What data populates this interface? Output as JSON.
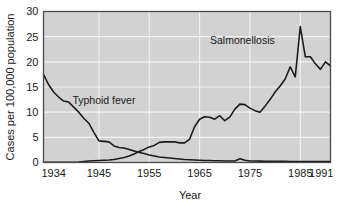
{
  "chart_data": {
    "type": "line",
    "title": "",
    "xlabel": "Year",
    "ylabel": "Cases per 100,000 population",
    "xlim": [
      1934,
      1991
    ],
    "ylim": [
      0,
      30
    ],
    "xticks": [
      1934,
      1945,
      1955,
      1965,
      1975,
      1985,
      1991
    ],
    "xtick_labels": [
      "1934",
      "1945",
      "1955",
      "1965",
      "1975",
      "1985",
      "1991"
    ],
    "yticks": [
      0,
      5,
      10,
      15,
      20,
      25,
      30
    ],
    "ytick_labels": [
      "0",
      "5",
      "10",
      "15",
      "20",
      "25",
      "30"
    ],
    "grid": true,
    "grid_color": "#f2f2f2",
    "plot_background": "#d2d2d2",
    "line_color": "#1a1a1a",
    "legend": "inline-annotations",
    "annotations": [
      {
        "text": "Typhoid fever",
        "x": 1946,
        "y": 11.6
      },
      {
        "text": "Salmonellosis",
        "x": 1973.5,
        "y": 23.6
      }
    ],
    "series": [
      {
        "name": "Typhoid fever",
        "x": [
          1934,
          1935,
          1936,
          1937,
          1938,
          1939,
          1940,
          1941,
          1942,
          1943,
          1944,
          1945,
          1946,
          1947,
          1948,
          1949,
          1950,
          1951,
          1952,
          1953,
          1954,
          1955,
          1956,
          1957,
          1958,
          1959,
          1960,
          1961,
          1962,
          1963,
          1964,
          1965,
          1966,
          1967,
          1968,
          1969,
          1970,
          1971,
          1972,
          1973,
          1974,
          1975,
          1976,
          1977,
          1978,
          1979,
          1980,
          1981,
          1982,
          1983,
          1984,
          1985,
          1986,
          1987,
          1988,
          1989,
          1990,
          1991
        ],
        "values": [
          17.5,
          15.5,
          14.0,
          13.0,
          12.2,
          12.0,
          11.0,
          10.0,
          8.8,
          7.8,
          6.0,
          4.3,
          4.2,
          4.1,
          3.3,
          3.0,
          2.9,
          2.6,
          2.3,
          2.0,
          1.8,
          1.5,
          1.3,
          1.1,
          1.0,
          0.9,
          0.8,
          0.7,
          0.6,
          0.55,
          0.5,
          0.45,
          0.4,
          0.38,
          0.35,
          0.33,
          0.3,
          0.3,
          0.3,
          0.75,
          0.45,
          0.3,
          0.28,
          0.27,
          0.26,
          0.25,
          0.24,
          0.23,
          0.22,
          0.21,
          0.2,
          0.2,
          0.2,
          0.2,
          0.2,
          0.2,
          0.2,
          0.2
        ]
      },
      {
        "name": "Salmonellosis",
        "x": [
          1934,
          1935,
          1936,
          1937,
          1938,
          1939,
          1940,
          1941,
          1942,
          1943,
          1944,
          1945,
          1946,
          1947,
          1948,
          1949,
          1950,
          1951,
          1952,
          1953,
          1954,
          1955,
          1956,
          1957,
          1958,
          1959,
          1960,
          1961,
          1962,
          1963,
          1964,
          1965,
          1966,
          1967,
          1968,
          1969,
          1970,
          1971,
          1972,
          1973,
          1974,
          1975,
          1976,
          1977,
          1978,
          1979,
          1980,
          1981,
          1982,
          1983,
          1984,
          1985,
          1986,
          1987,
          1988,
          1989,
          1990,
          1991
        ],
        "values": [
          0.05,
          0.05,
          0.05,
          0.05,
          0.05,
          0.05,
          0.05,
          0.1,
          0.2,
          0.3,
          0.35,
          0.4,
          0.45,
          0.5,
          0.6,
          0.8,
          1.0,
          1.3,
          1.7,
          2.2,
          2.6,
          3.1,
          3.4,
          4.0,
          4.1,
          4.1,
          4.1,
          3.9,
          3.9,
          4.6,
          7.1,
          8.6,
          9.1,
          9.0,
          8.6,
          9.3,
          8.3,
          9.0,
          10.6,
          11.6,
          11.5,
          10.8,
          10.3,
          10.0,
          11.2,
          12.5,
          14.0,
          15.2,
          16.6,
          19.0,
          17.0,
          27.0,
          21.0,
          21.0,
          19.6,
          18.5,
          20.0,
          19.2
        ]
      }
    ]
  },
  "axes": {
    "y_axis_title": "Cases per 100,000 population",
    "x_axis_title": "Year"
  }
}
